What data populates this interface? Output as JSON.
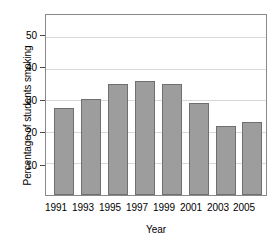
{
  "chart_data": {
    "type": "bar",
    "title": "",
    "subtitle": "",
    "xlabel": "Year",
    "ylabel": "Percentage of students smoking",
    "categories": [
      "1991",
      "1993",
      "1995",
      "1997",
      "1999",
      "2001",
      "2003",
      "2005"
    ],
    "values": [
      27.5,
      30.5,
      35,
      36,
      35,
      29,
      22,
      23
    ],
    "series": [
      {
        "name": "Percentage of students smoking",
        "values": [
          27.5,
          30.5,
          35,
          36,
          35,
          29,
          22,
          23
        ]
      }
    ],
    "ylim": [
      0,
      57
    ],
    "yticks": [
      10,
      20,
      30,
      40,
      50
    ],
    "ytick_labels": [
      "10",
      "20",
      "30",
      "40",
      "50"
    ],
    "xtick_labels": [
      "1991",
      "1993",
      "1995",
      "1997",
      "1999",
      "2001",
      "2003",
      "2005"
    ],
    "grid": true,
    "grid_axis": "y",
    "legend": false,
    "legend_position": "none",
    "bar_color": "#9d9d9d",
    "bar_edge_color": "#6f6f6f",
    "grid_color": "#d8d8d8",
    "axis_color": "#8a8a8a",
    "text_color": "#000000",
    "background_color": "#ffffff"
  }
}
